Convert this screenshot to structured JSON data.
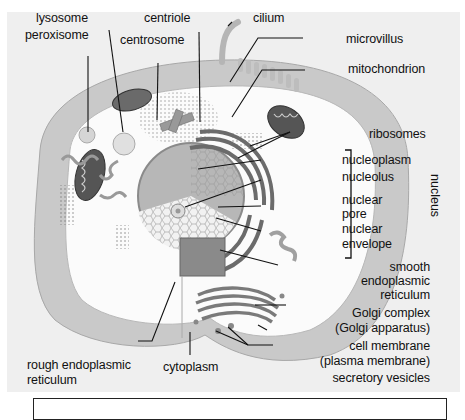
{
  "diagram": {
    "style": "grayscale illustration",
    "labels": {
      "lysosome": "lysosome",
      "peroxisome": "peroxisome",
      "centriole": "centriole",
      "centrosome": "centrosome",
      "cilium": "cilium",
      "microvillus": "microvillus",
      "mitochondrion": "mitochondrion",
      "ribosomes": "ribosomes",
      "nucleoplasm": "nucleoplasm",
      "nucleolus": "nucleolus",
      "nuclear_pore_1": "nuclear",
      "nuclear_pore_2": "pore",
      "nuclear_envelope_1": "nuclear",
      "nuclear_envelope_2": "envelope",
      "nucleus_bracket": "nucleus",
      "smooth_er_1": "smooth",
      "smooth_er_2": "endoplasmic",
      "smooth_er_3": "reticulum",
      "golgi_1": "Golgi complex",
      "golgi_2": "(Golgi apparatus)",
      "cell_membrane_1": "cell membrane",
      "cell_membrane_2": "(plasma membrane)",
      "secretory_vesicles": "secretory vesicles",
      "rough_er_1": "rough endoplasmic",
      "rough_er_2": "reticulum",
      "cytoplasm": "cytoplasm"
    }
  }
}
